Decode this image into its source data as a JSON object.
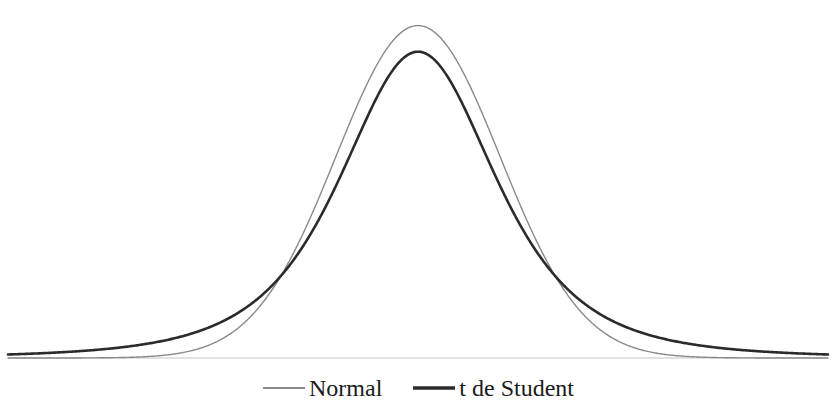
{
  "chart_data": {
    "type": "line",
    "title": "",
    "subtitle": "",
    "xlabel": "",
    "ylabel": "",
    "grid": false,
    "axes_visible": false,
    "tick_labels_visible": false,
    "legend_position": "bottom-center",
    "xlim": [
      -5,
      5
    ],
    "ylim": [
      0,
      0.42
    ],
    "baseline_color": "#d8d8d8",
    "x": [
      -5,
      -4.6,
      -4.2,
      -3.8,
      -3.4,
      -3,
      -2.6,
      -2.2,
      -1.8,
      -1.4,
      -1,
      -0.6,
      -0.2,
      0,
      0.2,
      0.6,
      1,
      1.4,
      1.8,
      2.2,
      2.6,
      3,
      3.4,
      3.8,
      4.2,
      4.6,
      5
    ],
    "series": [
      {
        "name": "Normal",
        "color": "#8a8a8a",
        "line_width": 1.4,
        "peak_x": 0,
        "peak_y": 0.399,
        "values": [
          1.5e-06,
          8.9e-06,
          4.65e-05,
          0.000214,
          0.001232,
          0.004432,
          0.013583,
          0.035475,
          0.07895,
          0.149727,
          0.241971,
          0.333225,
          0.391043,
          0.398942,
          0.391043,
          0.333225,
          0.241971,
          0.149727,
          0.07895,
          0.035475,
          0.013583,
          0.004432,
          0.001232,
          0.000214,
          4.65e-05,
          8.9e-06,
          1.5e-06
        ]
      },
      {
        "name": "t de Student",
        "color": "#2b2b2b",
        "line_width": 2.6,
        "peak_x": 0,
        "peak_y": 0.349,
        "values": [
          0.003664,
          0.005028,
          0.007045,
          0.010102,
          0.01487,
          0.022489,
          0.035032,
          0.056265,
          0.093095,
          0.157196,
          0.258204,
          0.35,
          0.344832,
          0.349,
          0.344832,
          0.35,
          0.258204,
          0.157196,
          0.093095,
          0.056265,
          0.035032,
          0.022489,
          0.01487,
          0.010102,
          0.007045,
          0.005028,
          0.003664
        ]
      }
    ],
    "annotations": {
      "crossover_points_x": [
        -1.45,
        1.45
      ],
      "note": "Curves intersect on both shoulders; beyond the crossovers the t density lies above the normal density in the tails."
    }
  },
  "legend": {
    "items": [
      {
        "label": "Normal",
        "marker": "line-swatch-gray"
      },
      {
        "label": "t de Student",
        "marker": "line-swatch-dark"
      }
    ]
  }
}
